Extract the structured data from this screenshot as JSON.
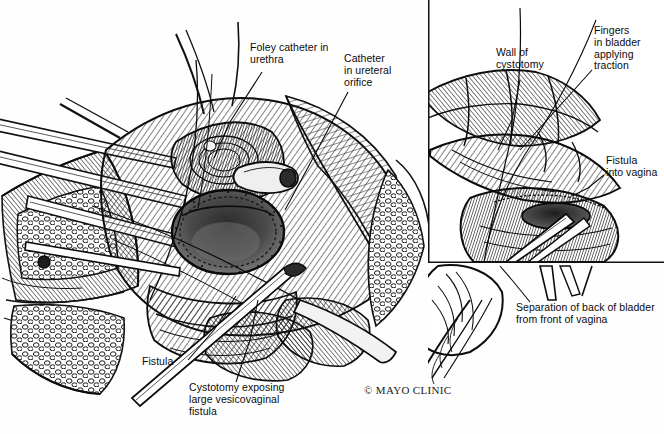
{
  "illustration": {
    "title": "Cystotomy exposing large vesicovaginal fistula",
    "credit": "© MAYO CLINIC",
    "style": "pen-and-ink medical illustration",
    "background_color": "#ffffff",
    "ink_color": "#111111"
  },
  "main_panel": {
    "name": "main-surgical-view",
    "labels": [
      {
        "id": "foley",
        "text": "Foley catheter in\nurethra",
        "x": 250,
        "y": 47,
        "leader": [
          [
            262,
            72
          ],
          [
            230,
            122
          ],
          [
            214,
            158
          ]
        ]
      },
      {
        "id": "ureteral",
        "text": "Catheter\nin ureteral\norifice",
        "x": 344,
        "y": 58,
        "leader": [
          [
            348,
            92
          ],
          [
            312,
            160
          ],
          [
            285,
            210
          ]
        ]
      },
      {
        "id": "fistula",
        "text": "Fistula",
        "x": 142,
        "y": 361,
        "leader": [
          [
            188,
            360
          ],
          [
            214,
            330
          ],
          [
            236,
            296
          ]
        ]
      },
      {
        "id": "cystotomy",
        "text": "Cystotomy exposing\nlarge vesicovaginal\nfistula",
        "x": 189,
        "y": 387,
        "leader": [
          [
            236,
            382
          ],
          [
            250,
            340
          ],
          [
            258,
            300
          ]
        ]
      }
    ]
  },
  "inset_panel": {
    "name": "inset-detail-view",
    "frame": {
      "x": 428,
      "y": 0,
      "width": 236,
      "height": 264,
      "borders": "left-and-bottom",
      "border_color": "#111111"
    },
    "labels": [
      {
        "id": "wall",
        "text": "Wall of\ncystotomy",
        "x": 496,
        "y": 52,
        "leader": [
          [
            520,
            80
          ],
          [
            512,
            120
          ],
          [
            498,
            150
          ]
        ]
      },
      {
        "id": "fingers",
        "text": "Fingers\nin bladder\napplying\ntraction",
        "x": 594,
        "y": 30,
        "leader": [
          [
            592,
            70
          ],
          [
            556,
            110
          ],
          [
            520,
            150
          ]
        ]
      }
    ]
  },
  "outer_labels": [
    {
      "id": "fistula-vagina",
      "text": "Fistula\ninto vagina",
      "x": 606,
      "y": 160,
      "leader": [
        [
          604,
          175
        ],
        [
          588,
          188
        ],
        [
          572,
          196
        ]
      ]
    },
    {
      "id": "separation",
      "text": "Separation of back of bladder\nfrom front of vagina",
      "x": 516,
      "y": 307,
      "leader": [
        [
          530,
          302
        ],
        [
          512,
          280
        ],
        [
          500,
          266
        ]
      ]
    }
  ],
  "credit_position": {
    "x": 364,
    "y": 388
  }
}
